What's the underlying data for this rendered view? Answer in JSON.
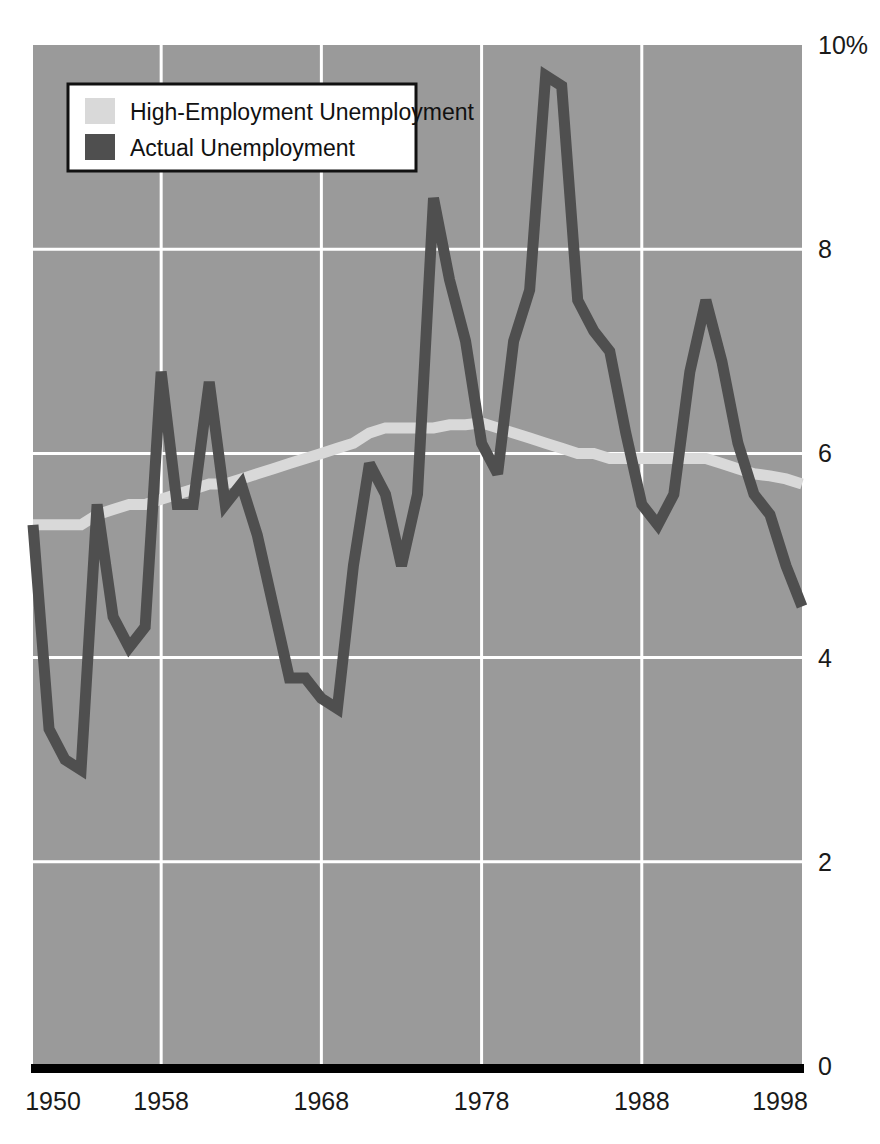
{
  "chart_data": {
    "type": "line",
    "title": "",
    "xlabel": "",
    "ylabel": "",
    "xlim": [
      1950,
      1998
    ],
    "ylim": [
      0,
      10
    ],
    "grid": true,
    "legend_position": "top-left",
    "y_ticks": [
      "10%",
      "8",
      "6",
      "4",
      "2",
      "0"
    ],
    "y_tick_values": [
      10,
      8,
      6,
      4,
      2,
      0
    ],
    "x_ticks": [
      "1950",
      "1958",
      "1968",
      "1978",
      "1988",
      "1998"
    ],
    "x_tick_values": [
      1950,
      1958,
      1968,
      1978,
      1988,
      1998
    ],
    "x": [
      1950,
      1951,
      1952,
      1953,
      1954,
      1955,
      1956,
      1957,
      1958,
      1959,
      1960,
      1961,
      1962,
      1963,
      1964,
      1965,
      1966,
      1967,
      1968,
      1969,
      1970,
      1971,
      1972,
      1973,
      1974,
      1975,
      1976,
      1977,
      1978,
      1979,
      1980,
      1981,
      1982,
      1983,
      1984,
      1985,
      1986,
      1987,
      1988,
      1989,
      1990,
      1991,
      1992,
      1993,
      1994,
      1995,
      1996,
      1997,
      1998
    ],
    "series": [
      {
        "name": "High-Employment Unemployment",
        "color": "#d9d9d9",
        "values": [
          5.3,
          5.3,
          5.3,
          5.3,
          5.4,
          5.45,
          5.5,
          5.5,
          5.55,
          5.6,
          5.65,
          5.7,
          5.7,
          5.75,
          5.8,
          5.85,
          5.9,
          5.95,
          6.0,
          6.05,
          6.1,
          6.2,
          6.25,
          6.25,
          6.25,
          6.25,
          6.28,
          6.28,
          6.3,
          6.25,
          6.2,
          6.15,
          6.1,
          6.05,
          6.0,
          6.0,
          5.95,
          5.95,
          5.95,
          5.95,
          5.95,
          5.95,
          5.95,
          5.9,
          5.85,
          5.8,
          5.78,
          5.75,
          5.7
        ]
      },
      {
        "name": "Actual Unemployment",
        "color": "#4f4f4f",
        "values": [
          5.3,
          3.3,
          3.0,
          2.9,
          5.5,
          4.4,
          4.1,
          4.3,
          6.8,
          5.5,
          5.5,
          6.7,
          5.5,
          5.7,
          5.2,
          4.5,
          3.8,
          3.8,
          3.6,
          3.5,
          4.9,
          5.9,
          5.6,
          4.9,
          5.6,
          8.5,
          7.7,
          7.1,
          6.1,
          5.8,
          7.1,
          7.6,
          9.7,
          9.6,
          7.5,
          7.2,
          7.0,
          6.2,
          5.5,
          5.3,
          5.6,
          6.8,
          7.5,
          6.9,
          6.1,
          5.6,
          5.4,
          4.9,
          4.5
        ]
      }
    ]
  },
  "legend": {
    "items": [
      {
        "label": "High-Employment Unemployment",
        "color": "#d9d9d9"
      },
      {
        "label": "Actual Unemployment",
        "color": "#4f4f4f"
      }
    ]
  },
  "axes": {
    "y_labels": [
      "10%",
      "8",
      "6",
      "4",
      "2",
      "0"
    ],
    "x_labels": [
      "1950",
      "1958",
      "1968",
      "1978",
      "1988",
      "1998"
    ]
  },
  "colors": {
    "plot_background": "#9a9a9a",
    "gridline": "#ffffff",
    "baseline": "#000000",
    "series_light": "#d9d9d9",
    "series_dark": "#4f4f4f",
    "text": "#1a1a1a"
  }
}
